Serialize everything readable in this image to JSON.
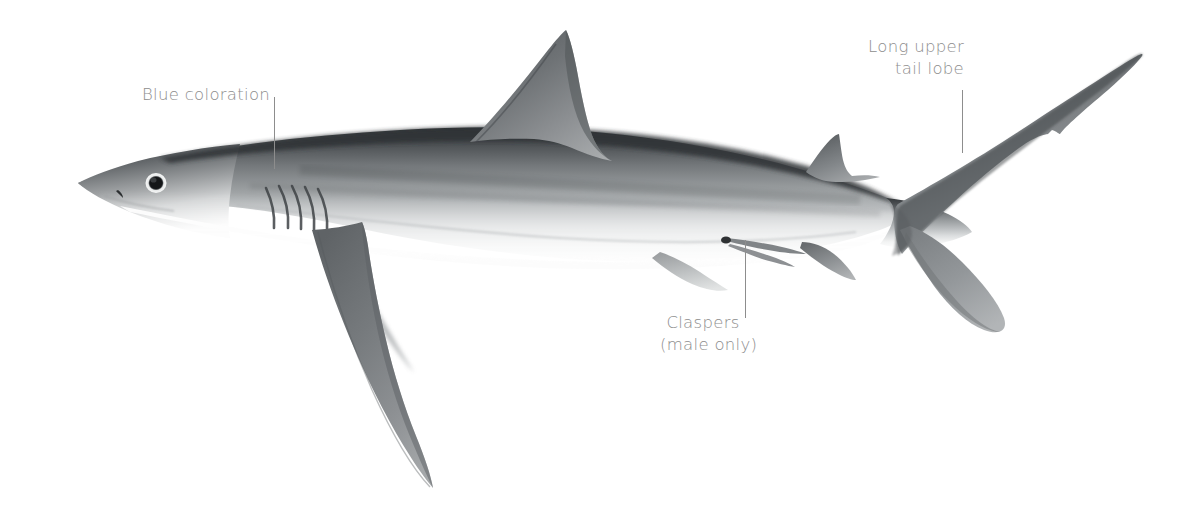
{
  "figure": {
    "orientation": "left-facing lateral view",
    "background_color": "#ffffff",
    "label_color": "#8d8d8d",
    "leader_color": "#8d8d8d"
  },
  "annotations": [
    {
      "id": "blue-coloration",
      "text": "Blue coloration",
      "lines": [
        "Blue coloration"
      ],
      "align": "left",
      "points_to": "dorsal back surface"
    },
    {
      "id": "long-upper-tail-lobe",
      "text": "Long upper\ntail lobe",
      "lines": [
        "Long upper",
        "tail lobe"
      ],
      "align": "right",
      "points_to": "upper caudal fin lobe"
    },
    {
      "id": "claspers",
      "text": "Claspers\n(male only)",
      "lines": [
        "Claspers",
        "(male only)"
      ],
      "align": "center",
      "points_to": "pelvic region claspers"
    }
  ],
  "anatomy": {
    "parts": [
      "pointed snout",
      "eye",
      "nostril",
      "five gill slits",
      "first dorsal fin",
      "second dorsal fin",
      "long sickle pectoral fin",
      "pelvic fin",
      "claspers",
      "anal fin",
      "caudal peduncle",
      "long upper caudal lobe",
      "short lower caudal lobe"
    ]
  },
  "palette": {
    "dorsal_dark": "#3c3f42",
    "flank_mid": "#8f9295",
    "flank_light": "#b9bcbe",
    "belly_white": "#fbfbfb",
    "outline": "#6d7073"
  }
}
